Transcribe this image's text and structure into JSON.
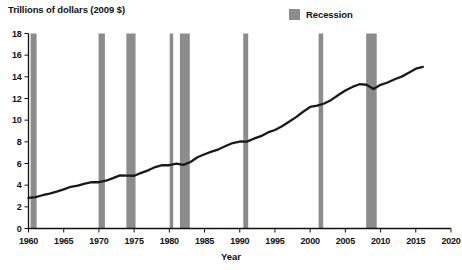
{
  "chart_data": {
    "type": "line",
    "title": "Trillions of dollars (2009 $)",
    "ylabel": "Trillions of dollars (2009 $)",
    "xlabel": "Year",
    "xlim": [
      1960,
      2020
    ],
    "ylim": [
      0,
      18
    ],
    "grid": false,
    "legend_position": "top-right",
    "legend": [
      {
        "label": "Recession",
        "color": "#8c8c8c"
      }
    ],
    "line_color": "#1a1a1a",
    "xticks": [
      1960,
      1965,
      1970,
      1975,
      1980,
      1985,
      1990,
      1995,
      2000,
      2005,
      2010,
      2015,
      2020
    ],
    "xtick_labels": [
      "1960",
      "1965",
      "1970",
      "1975",
      "1980",
      "1985",
      "1990",
      "1995",
      "2000",
      "2005",
      "2010",
      "2015",
      "2020"
    ],
    "yticks": [
      0,
      2,
      4,
      6,
      8,
      10,
      12,
      14,
      16,
      18
    ],
    "ytick_labels": [
      "0",
      "2",
      "4",
      "6",
      "8",
      "10",
      "12",
      "14",
      "16",
      "18"
    ],
    "series": [
      {
        "name": "Real GDP",
        "x": [
          1960,
          1961,
          1962,
          1963,
          1964,
          1965,
          1966,
          1967,
          1968,
          1969,
          1970,
          1971,
          1972,
          1973,
          1974,
          1975,
          1976,
          1977,
          1978,
          1979,
          1980,
          1981,
          1982,
          1983,
          1984,
          1985,
          1986,
          1987,
          1988,
          1989,
          1990,
          1991,
          1992,
          1993,
          1994,
          1995,
          1996,
          1997,
          1998,
          1999,
          2000,
          2001,
          2002,
          2003,
          2004,
          2005,
          2006,
          2007,
          2008,
          2009,
          2010,
          2011,
          2012,
          2013,
          2014,
          2015,
          2016
        ],
        "values": [
          2.83,
          2.9,
          3.07,
          3.21,
          3.4,
          3.61,
          3.85,
          3.95,
          4.14,
          4.27,
          4.27,
          4.41,
          4.65,
          4.91,
          4.88,
          4.87,
          5.13,
          5.37,
          5.67,
          5.85,
          5.84,
          5.99,
          5.87,
          6.14,
          6.58,
          6.85,
          7.09,
          7.31,
          7.61,
          7.89,
          8.03,
          8.02,
          8.29,
          8.52,
          8.87,
          9.09,
          9.43,
          9.85,
          10.28,
          10.78,
          11.22,
          11.35,
          11.54,
          11.87,
          12.32,
          12.73,
          13.07,
          13.32,
          13.27,
          12.88,
          13.26,
          13.48,
          13.78,
          14.02,
          14.38,
          14.75,
          14.92
        ]
      }
    ],
    "recessions": [
      {
        "start": 1960.3,
        "end": 1961.15
      },
      {
        "start": 1969.95,
        "end": 1970.85
      },
      {
        "start": 1973.9,
        "end": 1975.2
      },
      {
        "start": 1980.05,
        "end": 1980.55
      },
      {
        "start": 1981.5,
        "end": 1982.9
      },
      {
        "start": 1990.5,
        "end": 1991.2
      },
      {
        "start": 2001.2,
        "end": 2001.85
      },
      {
        "start": 2007.95,
        "end": 2009.45
      }
    ]
  }
}
